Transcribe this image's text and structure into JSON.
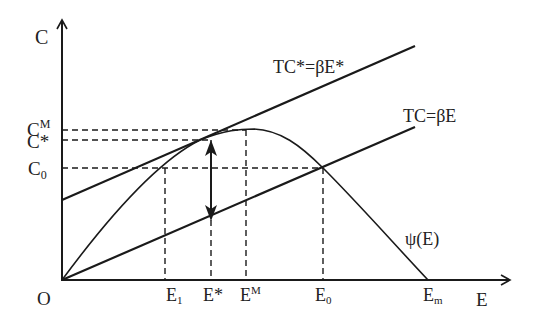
{
  "diagram": {
    "axes": {
      "y_label": "C",
      "x_label": "E",
      "origin_label": "O"
    },
    "y_ticks": [
      {
        "base": "C",
        "sup": "M",
        "sub": ""
      },
      {
        "base": "C*",
        "sup": "",
        "sub": ""
      },
      {
        "base": "C",
        "sup": "",
        "sub": "0"
      }
    ],
    "x_ticks": [
      {
        "base": "E",
        "sup": "",
        "sub": "1"
      },
      {
        "base": "E*",
        "sup": "",
        "sub": ""
      },
      {
        "base": "E",
        "sup": "M",
        "sub": ""
      },
      {
        "base": "E",
        "sup": "",
        "sub": "0"
      },
      {
        "base": "E",
        "sup": "",
        "sub": "m"
      }
    ],
    "curves": {
      "tc_star_label": "TC*=βE*",
      "tc_label": "TC=βE",
      "psi_label": "ψ(E)"
    },
    "colors": {
      "line": "#1a1a1a",
      "text": "#222222"
    }
  }
}
